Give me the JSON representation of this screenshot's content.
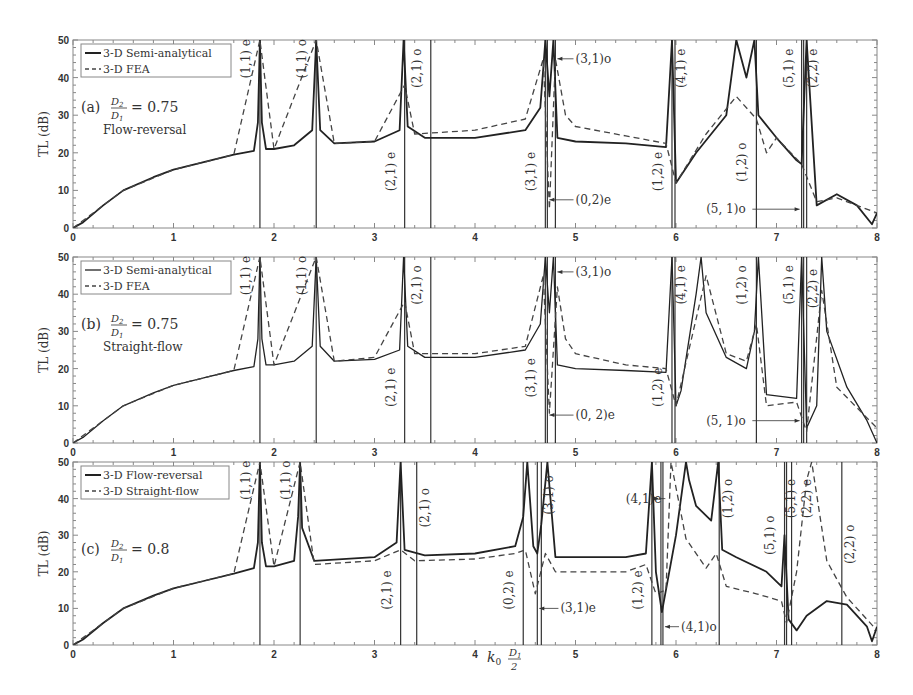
{
  "chart_data": [
    {
      "type": "line",
      "panel": "a",
      "title": "(a) D2/D1 = 0.75",
      "subtitle": "Flow-reversal",
      "panel_label": "(a)",
      "ratio_text": "= 0.75",
      "config_text": "Flow-reversal",
      "xlabel": "",
      "ylabel": "TL (dB)",
      "xlim": [
        0,
        8
      ],
      "ylim": [
        0,
        50
      ],
      "xticks": [
        0,
        1,
        2,
        3,
        4,
        5,
        6,
        7,
        8
      ],
      "yticks": [
        0,
        10,
        20,
        30,
        40,
        50
      ],
      "legend": [
        "3-D Semi-analytical",
        "3-D FEA"
      ],
      "legend_position": "upper left",
      "series": [
        {
          "name": "3-D Semi-analytical",
          "style": "solid",
          "x": [
            0,
            0.1,
            0.3,
            0.5,
            0.8,
            1.0,
            1.3,
            1.6,
            1.8,
            1.84,
            1.86,
            1.88,
            1.92,
            2.0,
            2.2,
            2.38,
            2.42,
            2.46,
            2.6,
            3.0,
            3.25,
            3.29,
            3.33,
            3.5,
            4.0,
            4.5,
            4.65,
            4.7,
            4.74,
            4.78,
            4.82,
            5.0,
            5.5,
            5.9,
            5.96,
            6.0,
            6.2,
            6.5,
            6.6,
            6.7,
            6.78,
            6.82,
            7.0,
            7.2,
            7.25,
            7.3,
            7.4,
            7.6,
            7.8,
            7.95,
            8.0
          ],
          "y": [
            0,
            1.5,
            6,
            10,
            13.5,
            15.5,
            17.5,
            19.5,
            20.5,
            28,
            50,
            28,
            21,
            21,
            22,
            26,
            50,
            26,
            22.5,
            23,
            26,
            50,
            27,
            24,
            24,
            26,
            32,
            50,
            35,
            50,
            24,
            23,
            22.5,
            21.5,
            50,
            12,
            20,
            30,
            50,
            40,
            50,
            30,
            24,
            18,
            17,
            50,
            6,
            9,
            6,
            1,
            4
          ]
        },
        {
          "name": "3-D FEA",
          "style": "dashed",
          "x": [
            0,
            0.5,
            1.0,
            1.6,
            1.86,
            2.0,
            2.42,
            2.6,
            3.0,
            3.3,
            3.4,
            4.0,
            4.5,
            4.68,
            4.74,
            4.8,
            4.9,
            5.0,
            5.5,
            5.9,
            6.0,
            6.3,
            6.6,
            6.8,
            6.9,
            7.0,
            7.25,
            7.4,
            7.6,
            8.0
          ],
          "y": [
            0,
            10,
            15.5,
            19.5,
            50,
            21,
            50,
            22.5,
            23,
            38,
            25,
            26,
            29,
            45,
            5,
            45,
            30,
            27,
            24.5,
            22.5,
            12,
            25,
            35,
            29,
            20,
            24,
            17,
            7,
            8,
            4
          ]
        }
      ],
      "annotations": [
        "(1,1) e",
        "(1,1) o",
        "(2,1) e",
        "(2,1) o",
        "(3,1) e",
        "(3,1)o",
        "(0,2)e",
        "(1,2) e",
        "(4,1) e",
        "(1,2) o",
        "(5,1) e",
        "(2,2) e",
        "(5, 1)o"
      ],
      "vertical_lines": [
        1.86,
        2.42,
        3.3,
        3.56,
        4.7,
        4.72,
        4.8,
        5.96,
        5.99,
        6.8,
        7.25,
        7.27,
        7.3
      ]
    },
    {
      "type": "line",
      "panel": "b",
      "title": "(b) D2/D1 = 0.75",
      "subtitle": "Straight-flow",
      "panel_label": "(b)",
      "ratio_text": "= 0.75",
      "config_text": "Straight-flow",
      "xlabel": "",
      "ylabel": "TL (dB)",
      "xlim": [
        0,
        8
      ],
      "ylim": [
        0,
        50
      ],
      "xticks": [
        0,
        1,
        2,
        3,
        4,
        5,
        6,
        7,
        8
      ],
      "yticks": [
        0,
        10,
        20,
        30,
        40,
        50
      ],
      "legend": [
        "3-D Semi-analytical",
        "3-D FEA"
      ],
      "legend_position": "upper left",
      "series": [
        {
          "name": "3-D Semi-analytical",
          "style": "solid",
          "x": [
            0,
            0.1,
            0.3,
            0.5,
            0.8,
            1.0,
            1.3,
            1.6,
            1.8,
            1.84,
            1.86,
            1.88,
            1.92,
            2.0,
            2.2,
            2.38,
            2.42,
            2.46,
            2.6,
            3.0,
            3.25,
            3.29,
            3.33,
            3.5,
            4.0,
            4.5,
            4.65,
            4.7,
            4.74,
            4.78,
            4.82,
            5.0,
            5.5,
            5.9,
            5.96,
            6.0,
            6.05,
            6.2,
            6.25,
            6.3,
            6.5,
            6.7,
            6.78,
            6.82,
            6.9,
            7.2,
            7.25,
            7.3,
            7.4,
            7.45,
            7.5,
            7.7,
            7.9,
            8.0
          ],
          "y": [
            0,
            1.5,
            6,
            10,
            13.5,
            15.5,
            17.5,
            19.5,
            20.5,
            28,
            50,
            28,
            21,
            21,
            22,
            26,
            50,
            26,
            22,
            22.5,
            25,
            50,
            26,
            23,
            23,
            25,
            32,
            50,
            35,
            50,
            21,
            20,
            19.5,
            19,
            50,
            10,
            14,
            40,
            50,
            35,
            23,
            20,
            30,
            50,
            13,
            12,
            50,
            4,
            10,
            50,
            30,
            15,
            6,
            0,
            4
          ]
        },
        {
          "name": "3-D FEA",
          "style": "dashed",
          "x": [
            0,
            0.5,
            1.0,
            1.6,
            1.86,
            2.0,
            2.42,
            2.6,
            3.0,
            3.3,
            3.4,
            4.0,
            4.5,
            4.68,
            4.74,
            4.82,
            4.9,
            5.0,
            5.5,
            5.9,
            6.0,
            6.3,
            6.5,
            6.7,
            6.8,
            6.9,
            7.2,
            7.3,
            7.45,
            7.6,
            8.0
          ],
          "y": [
            0,
            10,
            15.5,
            19.5,
            50,
            21,
            50,
            22,
            23,
            38,
            24,
            24,
            26,
            45,
            8,
            42,
            28,
            24,
            21,
            20,
            10,
            45,
            24,
            22,
            32,
            10,
            11,
            3,
            41,
            15,
            4
          ]
        }
      ],
      "annotations": [
        "(1,1) e",
        "(1,1) o",
        "(2,1) e",
        "(2,1) o",
        "(3,1) e",
        "(3,1)o",
        "(0, 2)e",
        "(1,2) e",
        "(4,1) e",
        "(1,2) o",
        "(5,1) e",
        "(2,2) e",
        "(5, 1)o"
      ],
      "vertical_lines": [
        1.86,
        2.42,
        3.3,
        3.56,
        4.7,
        4.72,
        4.8,
        5.96,
        5.99,
        6.8,
        7.25,
        7.27,
        7.3
      ]
    },
    {
      "type": "line",
      "panel": "c",
      "title": "(c) D2/D1 = 0.8",
      "panel_label": "(c)",
      "ratio_text": "= 0.8",
      "xlabel": "k0 D1/2",
      "ylabel": "TL (dB)",
      "xlim": [
        0,
        8
      ],
      "ylim": [
        0,
        50
      ],
      "xticks": [
        0,
        1,
        2,
        3,
        4,
        5,
        6,
        7,
        8
      ],
      "yticks": [
        0,
        10,
        20,
        30,
        40,
        50
      ],
      "legend": [
        "3-D Flow-reversal",
        "3-D Straight-flow"
      ],
      "legend_position": "upper left",
      "series": [
        {
          "name": "3-D Flow-reversal",
          "style": "solid",
          "x": [
            0,
            0.1,
            0.3,
            0.5,
            0.8,
            1.0,
            1.3,
            1.6,
            1.8,
            1.84,
            1.86,
            1.88,
            1.92,
            2.0,
            2.2,
            2.24,
            2.26,
            2.28,
            2.4,
            3.0,
            3.22,
            3.26,
            3.3,
            3.5,
            4.0,
            4.4,
            4.48,
            4.52,
            4.58,
            4.62,
            4.66,
            4.72,
            4.8,
            5.0,
            5.5,
            5.7,
            5.76,
            5.8,
            5.86,
            6.0,
            6.1,
            6.13,
            6.2,
            6.35,
            6.42,
            6.46,
            6.6,
            6.9,
            7.05,
            7.08,
            7.12,
            7.2,
            7.3,
            7.5,
            7.7,
            7.9,
            7.95,
            8.0
          ],
          "y": [
            0,
            1.5,
            6,
            10,
            13.5,
            15.5,
            17.5,
            19.5,
            21,
            28,
            50,
            28,
            21.5,
            21.5,
            23,
            35,
            50,
            32,
            23,
            24,
            28,
            50,
            26,
            24.5,
            25,
            27,
            35,
            50,
            27,
            25,
            33,
            50,
            24,
            24,
            24,
            25,
            50,
            20,
            9,
            30,
            50,
            45,
            38,
            34,
            50,
            26,
            24,
            20,
            16,
            30,
            7,
            4,
            8,
            12,
            11,
            5,
            1,
            5
          ]
        },
        {
          "name": "3-D Straight-flow",
          "style": "dashed",
          "x": [
            0,
            0.5,
            1.0,
            1.6,
            1.86,
            2.0,
            2.26,
            2.4,
            3.0,
            3.26,
            3.4,
            4.0,
            4.4,
            4.5,
            4.6,
            4.7,
            4.8,
            5.0,
            5.5,
            5.7,
            5.8,
            5.9,
            5.95,
            6.1,
            6.3,
            6.4,
            6.5,
            6.8,
            7.05,
            7.1,
            7.2,
            7.3,
            7.35,
            7.5,
            7.7,
            8.0
          ],
          "y": [
            0,
            10,
            15.5,
            19.5,
            50,
            21.5,
            50,
            22,
            23,
            26,
            23,
            23.5,
            25,
            26,
            14,
            25,
            20,
            20,
            20,
            22,
            14,
            15,
            50,
            29,
            21,
            25,
            16,
            14,
            12,
            6,
            20,
            45,
            50,
            23,
            13,
            4
          ]
        }
      ],
      "annotations": [
        "(1,1) e",
        "(1,1) o",
        "(2,1) e",
        "(2,1) o",
        "(0,2) e",
        "(3,1)e",
        "(3,1) o",
        "(4,1)e",
        "(1,2) e",
        "(4,1)o",
        "(1,2) o",
        "(5,1) o",
        "(5,1) e",
        "(2,2) e",
        "(2,2) o"
      ],
      "vertical_lines": [
        1.86,
        2.26,
        3.26,
        3.42,
        4.48,
        4.62,
        4.66,
        5.76,
        5.85,
        5.87,
        6.43,
        7.08,
        7.1,
        7.15,
        7.65
      ]
    }
  ],
  "axis": {
    "ylabel": "TL (dB)",
    "xlabel_main": "k",
    "xlabel_sub": "0",
    "xlabel_num": "D",
    "xlabel_num_sub": "1",
    "xlabel_den": "2"
  },
  "ratio": {
    "num": "D",
    "num_sub": "2",
    "den": "D",
    "den_sub": "1"
  },
  "xtick_labels": [
    "0",
    "1",
    "2",
    "3",
    "4",
    "5",
    "6",
    "7",
    "8"
  ],
  "ytick_labels": [
    "0",
    "10",
    "20",
    "30",
    "40",
    "50"
  ]
}
